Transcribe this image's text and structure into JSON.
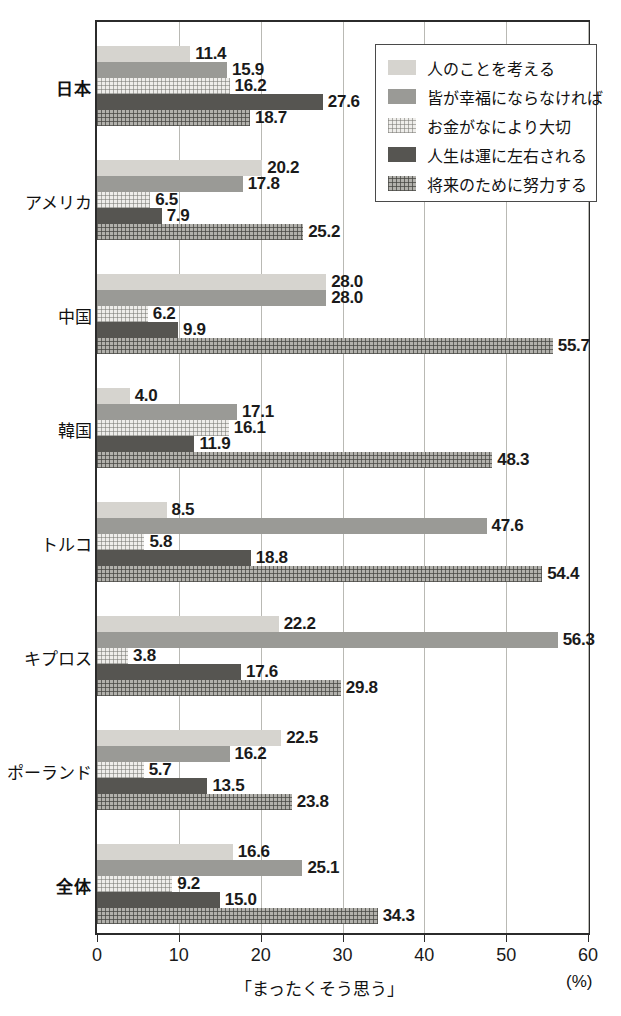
{
  "chart_data": {
    "type": "bar",
    "orientation": "horizontal",
    "title": "",
    "xlabel": "「まったくそう思う」",
    "xunit": "(%)",
    "ylabel": "",
    "xlim": [
      0,
      60
    ],
    "xticks": [
      0,
      10,
      20,
      30,
      40,
      50,
      60
    ],
    "grid": true,
    "legend_position": "top-right",
    "categories": [
      "日本",
      "アメリカ",
      "中国",
      "韓国",
      "トルコ",
      "キプロス",
      "ポーランド",
      "全体"
    ],
    "emphasized_categories": [
      "日本",
      "全体"
    ],
    "series": [
      {
        "name": "人のことを考える",
        "color": "#d6d4cf",
        "pattern": "solid-light",
        "values": [
          11.4,
          20.2,
          28.0,
          4.0,
          8.5,
          22.2,
          22.5,
          16.6
        ]
      },
      {
        "name": "皆が幸福にならなければ",
        "color": "#9a9a96",
        "pattern": "solid-medium",
        "values": [
          15.9,
          17.8,
          28.0,
          17.1,
          47.6,
          56.3,
          16.2,
          25.1
        ]
      },
      {
        "name": "お金がなにより大切",
        "color": "#eeedea",
        "pattern": "fine-grid-light",
        "values": [
          16.2,
          6.5,
          6.2,
          16.1,
          5.8,
          3.8,
          5.7,
          9.2
        ]
      },
      {
        "name": "人生は運に左右される",
        "color": "#565551",
        "pattern": "solid-dark",
        "values": [
          27.6,
          7.9,
          9.9,
          11.9,
          18.8,
          17.6,
          13.5,
          15.0
        ]
      },
      {
        "name": "将来のために努力する",
        "color": "#b2b1ac",
        "pattern": "grid-medium",
        "values": [
          18.7,
          25.2,
          55.7,
          48.3,
          54.4,
          29.8,
          23.8,
          34.3
        ]
      }
    ],
    "value_labels": [
      [
        "11.4",
        "15.9",
        "16.2",
        "27.6",
        "18.7"
      ],
      [
        "20.2",
        "17.8",
        "6.5",
        "7.9",
        "25.2"
      ],
      [
        "28.0",
        "28.0",
        "6.2",
        "9.9",
        "55.7"
      ],
      [
        "4.0",
        "17.1",
        "16.1",
        "11.9",
        "48.3"
      ],
      [
        "8.5",
        "47.6",
        "5.8",
        "18.8",
        "54.4"
      ],
      [
        "22.2",
        "56.3",
        "3.8",
        "17.6",
        "29.8"
      ],
      [
        "22.5",
        "16.2",
        "5.7",
        "13.5",
        "23.8"
      ],
      [
        "16.6",
        "25.1",
        "9.2",
        "15.0",
        "34.3"
      ]
    ]
  },
  "legend": {
    "items": [
      {
        "label": "人のことを考える"
      },
      {
        "label": "皆が幸福にならなければ"
      },
      {
        "label": "お金がなにより大切"
      },
      {
        "label": "人生は運に左右される"
      },
      {
        "label": "将来のために努力する"
      }
    ]
  },
  "axis": {
    "tick_labels": [
      "0",
      "10",
      "20",
      "30",
      "40",
      "50",
      "60"
    ],
    "title": "「まったくそう思う」",
    "unit": "(%)"
  }
}
